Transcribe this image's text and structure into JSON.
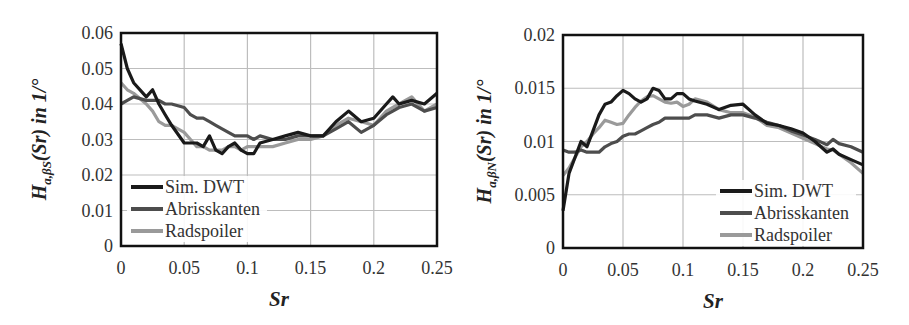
{
  "chart_data": [
    {
      "type": "line",
      "title": "",
      "xlabel": "Sr",
      "ylabel": "H_{a,βS}(Sr) in 1/°",
      "ylabel_parts": {
        "main": "H",
        "sub": "a,βS",
        "rest": "(Sr) in 1/°"
      },
      "xlim": [
        0,
        0.25
      ],
      "ylim": [
        0,
        0.06
      ],
      "xticks": [
        "0",
        "0.05",
        "0.1",
        "0.15",
        "0.2",
        "0.25"
      ],
      "yticks": [
        "0",
        "0.01",
        "0.02",
        "0.03",
        "0.04",
        "0.05",
        "0.06"
      ],
      "grid": true,
      "legend_position": "lower left",
      "x": [
        0,
        0.005,
        0.01,
        0.02,
        0.025,
        0.03,
        0.035,
        0.04,
        0.05,
        0.055,
        0.06,
        0.065,
        0.07,
        0.075,
        0.08,
        0.085,
        0.09,
        0.095,
        0.1,
        0.105,
        0.11,
        0.12,
        0.13,
        0.14,
        0.15,
        0.16,
        0.17,
        0.18,
        0.19,
        0.2,
        0.21,
        0.215,
        0.22,
        0.23,
        0.24,
        0.25
      ],
      "series": [
        {
          "name": "Sim. DWT",
          "color": "#1a1a1a",
          "values": [
            0.057,
            0.05,
            0.046,
            0.042,
            0.044,
            0.04,
            0.037,
            0.034,
            0.029,
            0.029,
            0.029,
            0.028,
            0.031,
            0.027,
            0.026,
            0.028,
            0.029,
            0.027,
            0.026,
            0.026,
            0.029,
            0.03,
            0.031,
            0.032,
            0.031,
            0.031,
            0.035,
            0.038,
            0.035,
            0.036,
            0.04,
            0.042,
            0.04,
            0.041,
            0.04,
            0.043
          ]
        },
        {
          "name": "Abrisskanten",
          "color": "#4d4d4d",
          "values": [
            0.04,
            0.041,
            0.042,
            0.041,
            0.041,
            0.041,
            0.04,
            0.04,
            0.039,
            0.037,
            0.036,
            0.036,
            0.035,
            0.034,
            0.033,
            0.032,
            0.031,
            0.031,
            0.031,
            0.03,
            0.031,
            0.03,
            0.03,
            0.031,
            0.031,
            0.031,
            0.033,
            0.035,
            0.032,
            0.034,
            0.037,
            0.038,
            0.039,
            0.04,
            0.038,
            0.039
          ]
        },
        {
          "name": "Radspoiler",
          "color": "#9a9a9a",
          "values": [
            0.046,
            0.044,
            0.043,
            0.04,
            0.038,
            0.035,
            0.034,
            0.034,
            0.032,
            0.03,
            0.028,
            0.028,
            0.027,
            0.027,
            0.027,
            0.028,
            0.028,
            0.027,
            0.028,
            0.028,
            0.028,
            0.028,
            0.029,
            0.03,
            0.03,
            0.031,
            0.034,
            0.036,
            0.035,
            0.034,
            0.038,
            0.039,
            0.04,
            0.042,
            0.038,
            0.04
          ]
        }
      ]
    },
    {
      "type": "line",
      "title": "",
      "xlabel": "Sr",
      "ylabel": "H_{a,βN}(Sr) in 1/°",
      "ylabel_parts": {
        "main": "H",
        "sub": "a,βN",
        "rest": "(Sr) in 1/°"
      },
      "xlim": [
        0,
        0.25
      ],
      "ylim": [
        0,
        0.02
      ],
      "xticks": [
        "0",
        "0.05",
        "0.1",
        "0.15",
        "0.2",
        "0.25"
      ],
      "yticks": [
        "0",
        "0.005",
        "0.01",
        "0.015",
        "0.02"
      ],
      "grid": true,
      "legend_position": "lower right",
      "x": [
        0,
        0.005,
        0.01,
        0.015,
        0.02,
        0.025,
        0.03,
        0.035,
        0.04,
        0.045,
        0.05,
        0.055,
        0.06,
        0.065,
        0.07,
        0.075,
        0.08,
        0.085,
        0.09,
        0.095,
        0.1,
        0.105,
        0.11,
        0.12,
        0.13,
        0.14,
        0.15,
        0.16,
        0.17,
        0.18,
        0.19,
        0.2,
        0.21,
        0.22,
        0.225,
        0.23,
        0.24,
        0.25
      ],
      "series": [
        {
          "name": "Sim. DWT",
          "color": "#1a1a1a",
          "values": [
            0.0035,
            0.007,
            0.0085,
            0.01,
            0.0095,
            0.011,
            0.0125,
            0.0135,
            0.0137,
            0.0143,
            0.0148,
            0.0145,
            0.014,
            0.0137,
            0.014,
            0.015,
            0.0148,
            0.014,
            0.014,
            0.0145,
            0.0145,
            0.014,
            0.0138,
            0.0135,
            0.013,
            0.0134,
            0.0135,
            0.0125,
            0.0117,
            0.0115,
            0.0112,
            0.0108,
            0.01,
            0.009,
            0.0093,
            0.0088,
            0.0083,
            0.0078
          ]
        },
        {
          "name": "Abrisskanten",
          "color": "#4d4d4d",
          "values": [
            0.0092,
            0.009,
            0.009,
            0.0092,
            0.009,
            0.009,
            0.009,
            0.0095,
            0.0098,
            0.01,
            0.0105,
            0.0107,
            0.0107,
            0.011,
            0.0113,
            0.0116,
            0.0118,
            0.0122,
            0.0122,
            0.0122,
            0.0122,
            0.0122,
            0.0125,
            0.0125,
            0.0122,
            0.0125,
            0.0125,
            0.0122,
            0.0118,
            0.0115,
            0.011,
            0.0106,
            0.0102,
            0.0097,
            0.0102,
            0.0098,
            0.0095,
            0.009
          ]
        },
        {
          "name": "Radspoiler",
          "color": "#9a9a9a",
          "values": [
            0.0068,
            0.0075,
            0.0085,
            0.0095,
            0.01,
            0.0107,
            0.0113,
            0.012,
            0.0118,
            0.0116,
            0.0117,
            0.0125,
            0.0132,
            0.0138,
            0.0142,
            0.0143,
            0.014,
            0.0137,
            0.0136,
            0.0137,
            0.0133,
            0.0135,
            0.014,
            0.0137,
            0.013,
            0.0127,
            0.0127,
            0.0123,
            0.0115,
            0.0113,
            0.0108,
            0.0103,
            0.0098,
            0.0093,
            0.0092,
            0.0088,
            0.008,
            0.007
          ]
        }
      ]
    }
  ],
  "legend_labels": [
    "Sim. DWT",
    "Abrisskanten",
    "Radspoiler"
  ]
}
